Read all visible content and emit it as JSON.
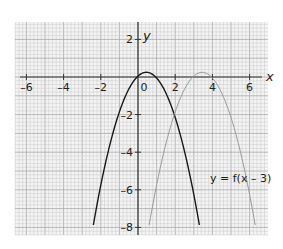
{
  "chart_data": {
    "type": "line",
    "title": "",
    "xlabel": "x",
    "ylabel": "y",
    "xlim": [
      -6.6,
      7
    ],
    "ylim": [
      -8.3,
      3
    ],
    "grid": true,
    "x_ticks": [
      -6,
      -4,
      -2,
      0,
      2,
      4,
      6
    ],
    "y_ticks": [
      2,
      -2,
      -4,
      -6,
      -8
    ],
    "x_tick_labels": [
      "–6",
      "–4",
      "–2",
      "0",
      "2",
      "4",
      "6"
    ],
    "y_tick_labels": [
      "2",
      "–2",
      "–4",
      "–6",
      "–8"
    ],
    "series": [
      {
        "name": "y = f(x)",
        "color": "#1a1a1a",
        "vertex": [
          0.45,
          0.25
        ],
        "x": [
          -2.4,
          -2,
          -1.5,
          -1,
          -0.5,
          0,
          0.45,
          1,
          1.5,
          2,
          2.5,
          3,
          3.3
        ],
        "y": [
          -7.87,
          -5.75,
          -3.55,
          -1.85,
          -0.65,
          0.05,
          0.25,
          -0.05,
          -0.85,
          -2.15,
          -3.95,
          -6.25,
          -7.87
        ]
      },
      {
        "name": "y = f(x – 3)",
        "color": "#9a9a9a",
        "vertex": [
          3.45,
          0.25
        ],
        "x": [
          0.6,
          1,
          1.5,
          2,
          2.5,
          3,
          3.45,
          4,
          4.5,
          5,
          5.5,
          6,
          6.3
        ],
        "y": [
          -7.87,
          -5.75,
          -3.55,
          -1.85,
          -0.65,
          0.05,
          0.25,
          -0.05,
          -0.85,
          -2.15,
          -3.95,
          -6.25,
          -7.87
        ]
      }
    ],
    "annotations": [
      {
        "text": "y = f(x – 3)",
        "x": 5.9,
        "y": -5.2
      }
    ]
  },
  "labels": {
    "x_axis": "x",
    "y_axis": "y",
    "curve_annotation": "y = f(x – 3)",
    "x_ticks": [
      "–6",
      "–4",
      "–2",
      "0",
      "2",
      "4",
      "6"
    ],
    "y_ticks": [
      "2",
      "–2",
      "–4",
      "–6",
      "–8"
    ]
  }
}
